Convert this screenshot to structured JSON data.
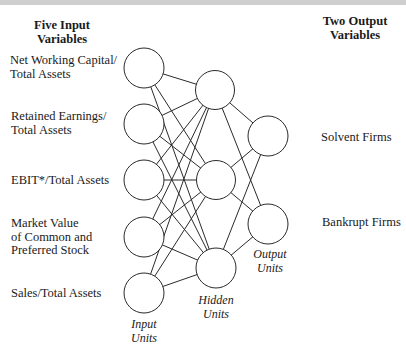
{
  "headers": {
    "inputs": "Five Input\nVariables",
    "outputs": "Two Output\nVariables"
  },
  "input_variables": [
    {
      "label": "Net Working Capital/\nTotal Assets"
    },
    {
      "label": "Retained Earnings/\nTotal Assets"
    },
    {
      "label": "EBIT*/Total Assets"
    },
    {
      "label": "Market Value\nof Common and\nPreferred Stock"
    },
    {
      "label": "Sales/Total Assets"
    }
  ],
  "output_variables": [
    {
      "label": "Solvent Firms"
    },
    {
      "label": "Bankrupt Firms"
    }
  ],
  "layer_labels": {
    "input": "Input\nUnits",
    "hidden": "Hidden\nUnits",
    "output": "Output\nUnits"
  },
  "network": {
    "input_units": 5,
    "hidden_units": 3,
    "output_units": 2,
    "connectivity": "fully-connected"
  },
  "colors": {
    "top_bar": "#cfcfcf",
    "stroke": "#2a2a2a",
    "background": "#ffffff"
  }
}
